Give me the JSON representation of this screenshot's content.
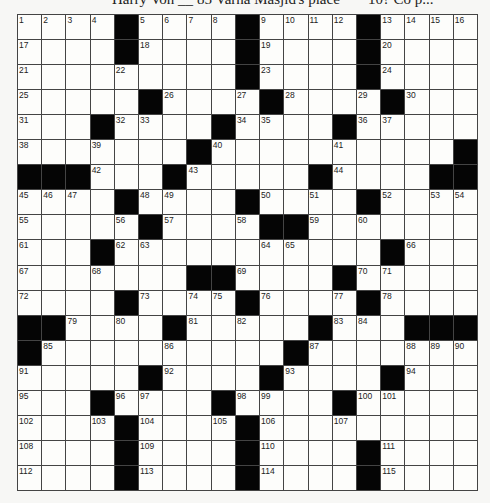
{
  "header": {
    "left": "Harry Von __",
    "middle": "85 Varna Masjid's place",
    "right": "10? Co p..."
  },
  "puzzle": {
    "rows": 19,
    "cols": 19,
    "black_marker": "#",
    "grid": [
      [
        "1",
        "2",
        "3",
        "4",
        "#",
        "5",
        "6",
        "7",
        "8",
        "#",
        "9",
        "10",
        "11",
        "12",
        "#",
        "13",
        "14",
        "15",
        "16"
      ],
      [
        "17",
        "",
        "",
        "",
        "#",
        "18",
        "",
        "",
        "",
        "#",
        "19",
        "",
        "",
        "",
        "#",
        "20",
        "",
        "",
        ""
      ],
      [
        "21",
        "",
        "",
        "",
        "22",
        "",
        "",
        "",
        "",
        "#",
        "23",
        "",
        "",
        "",
        "#",
        "24",
        "",
        "",
        ""
      ],
      [
        "25",
        "",
        "",
        "",
        "",
        "#",
        "26",
        "",
        "",
        "27",
        "#",
        "28",
        "",
        "",
        "29",
        "#",
        "30",
        "",
        ""
      ],
      [
        "31",
        "",
        "",
        "#",
        "32",
        "33",
        "",
        "",
        "#",
        "34",
        "35",
        "",
        "",
        "#",
        "36",
        "37",
        "",
        "",
        ""
      ],
      [
        "38",
        "",
        "",
        "39",
        "",
        "",
        "",
        "#",
        "40",
        "",
        "",
        "",
        "",
        "41",
        "",
        "",
        "",
        "",
        "#"
      ],
      [
        "#",
        "#",
        "#",
        "42",
        "",
        "",
        "#",
        "43",
        "",
        "",
        "",
        "",
        "#",
        "44",
        "",
        "",
        "",
        "#",
        "#"
      ],
      [
        "45",
        "46",
        "47",
        "",
        "#",
        "48",
        "49",
        "",
        "",
        "#",
        "50",
        "",
        "51",
        "",
        "#",
        "52",
        "",
        "53",
        "54"
      ],
      [
        "55",
        "",
        "",
        "",
        "56",
        "#",
        "57",
        "",
        "",
        "58",
        "#",
        "#",
        "59",
        "",
        "60",
        "",
        "",
        "",
        ""
      ],
      [
        "61",
        "",
        "",
        "#",
        "62",
        "63",
        "",
        "",
        "",
        "",
        "64",
        "65",
        "",
        "",
        "",
        "#",
        "66",
        "",
        ""
      ],
      [
        "67",
        "",
        "",
        "68",
        "",
        "",
        "",
        "#",
        "#",
        "69",
        "",
        "",
        "",
        "#",
        "70",
        "71",
        "",
        "",
        ""
      ],
      [
        "72",
        "",
        "",
        "",
        "#",
        "73",
        "",
        "74",
        "75",
        "#",
        "76",
        "",
        "",
        "77",
        "#",
        "78",
        "",
        "",
        ""
      ],
      [
        "#",
        "#",
        "79",
        "",
        "80",
        "",
        "#",
        "81",
        "",
        "82",
        "",
        "",
        "#",
        "83",
        "84",
        "",
        "#",
        "#",
        "#"
      ],
      [
        "#",
        "85",
        "",
        "",
        "",
        "",
        "86",
        "",
        "",
        "",
        "",
        "#",
        "87",
        "",
        "",
        "",
        "88",
        "89",
        "90"
      ],
      [
        "91",
        "",
        "",
        "",
        "",
        "#",
        "92",
        "",
        "",
        "",
        "#",
        "93",
        "",
        "",
        "",
        "#",
        "94",
        "",
        ""
      ],
      [
        "95",
        "",
        "",
        "#",
        "96",
        "97",
        "",
        "",
        "#",
        "98",
        "99",
        "",
        "",
        "#",
        "100",
        "101",
        "",
        "",
        ""
      ],
      [
        "102",
        "",
        "",
        "103",
        "#",
        "104",
        "",
        "",
        "105",
        "#",
        "106",
        "",
        "",
        "107",
        "",
        "",
        "",
        "",
        ""
      ],
      [
        "108",
        "",
        "",
        "",
        "#",
        "109",
        "",
        "",
        "",
        "#",
        "110",
        "",
        "",
        "",
        "#",
        "111",
        "",
        "",
        ""
      ],
      [
        "112",
        "",
        "",
        "",
        "#",
        "113",
        "",
        "",
        "",
        "#",
        "114",
        "",
        "",
        "",
        "#",
        "115",
        "",
        "",
        ""
      ]
    ]
  }
}
